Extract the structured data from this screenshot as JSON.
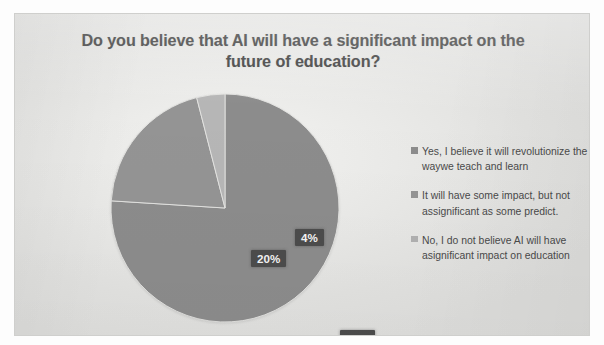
{
  "chart_data": {
    "type": "pie",
    "title": "Do you believe that AI will have a significant impact on the future of education?",
    "categories": [
      "Yes, I believe it will revolutionize the waywe teach and learn",
      "It will have some impact, but not assignificant as some predict.",
      "No, I do not believe AI will have asignificant impact on education"
    ],
    "values": [
      76,
      20,
      4
    ],
    "value_labels": [
      "76%",
      "20%",
      "4%"
    ],
    "unit": "%",
    "legend_position": "right",
    "grid": false,
    "colors": [
      "#8c8c8c",
      "#949494",
      "#b6b6b6"
    ],
    "label_text_color": "#f4f4f4",
    "label_background_color": "#4c4c4c",
    "title_color": "#3b3b3b",
    "panel_background_color": "#e9e9e7",
    "slices": [
      {
        "label": "76%",
        "value": 76,
        "legend": "Yes, I believe it will revolutionize the waywe teach and learn",
        "color": "#8c8c8c"
      },
      {
        "label": "20%",
        "value": 20,
        "legend": "It will have some impact, but not assignificant as some predict.",
        "color": "#949494"
      },
      {
        "label": "4%",
        "value": 4,
        "legend": "No, I do not believe AI will have asignificant impact on education",
        "color": "#b6b6b6"
      }
    ]
  },
  "title": {
    "line1": "Do you believe that AI will have a significant impact on the",
    "line2": "future of education?"
  },
  "labels": {
    "slice_76": "76%",
    "slice_20": "20%",
    "slice_4": "4%"
  },
  "legend": {
    "items": [
      {
        "text": "Yes, I believe it will revolutionize the waywe teach and learn",
        "color": "#8c8c8c"
      },
      {
        "text": "It will have some impact, but not assignificant as some predict.",
        "color": "#949494"
      },
      {
        "text": "No, I do not believe AI will have asignificant impact on education",
        "color": "#b0b0b0"
      }
    ]
  }
}
